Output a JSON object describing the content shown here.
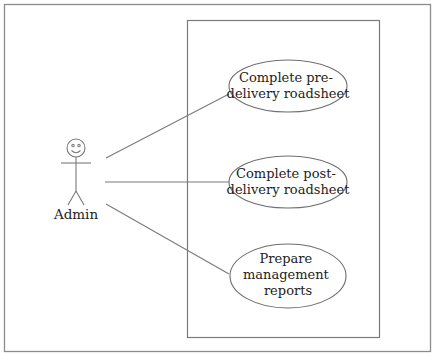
{
  "diagram": {
    "type": "use-case",
    "colors": {
      "stroke": "#7a7a7a",
      "frame": "#8c8c8c",
      "text": "#222222",
      "background": "#ffffff"
    },
    "actor": {
      "name": "Admin"
    },
    "system_boundary": {
      "label": ""
    },
    "use_cases": [
      {
        "id": "uc1",
        "lines": [
          "Complete pre-",
          "delivery roadsheet"
        ]
      },
      {
        "id": "uc2",
        "lines": [
          "Complete post-",
          "delivery roadsheet"
        ]
      },
      {
        "id": "uc3",
        "lines": [
          "Prepare",
          "management",
          "reports"
        ]
      }
    ],
    "associations": [
      {
        "from": "Admin",
        "to": "uc1"
      },
      {
        "from": "Admin",
        "to": "uc2"
      },
      {
        "from": "Admin",
        "to": "uc3"
      }
    ]
  }
}
